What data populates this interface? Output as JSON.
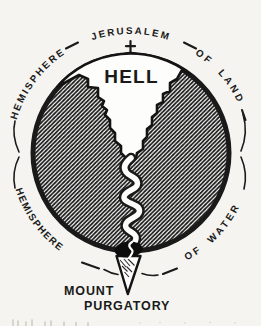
{
  "figure": {
    "labels": {
      "jerusalem": "JERUSALEM",
      "hemisphere_upper": "HEMISPHERE",
      "of_land": "OF LAND",
      "hell": "HELL",
      "hemisphere_lower": "HEMISPHERE",
      "of_water": "OF WATER",
      "mount": "MOUNT",
      "purgatory": "PURGATORY"
    },
    "icons": {
      "cross_icon": "†"
    },
    "colors": {
      "ink": "#1a1a1a",
      "paper": "#f5f4f0"
    }
  }
}
